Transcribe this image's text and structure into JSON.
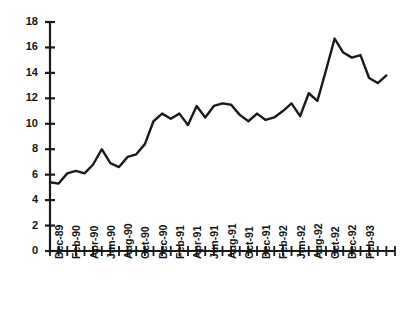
{
  "chart_data": {
    "type": "line",
    "title": "",
    "subtitle": "",
    "xlabel": "",
    "ylabel": "",
    "grid": false,
    "legend": false,
    "legend_position": "none",
    "line_color": "#1a1a1a",
    "background_color": "#ffffff",
    "ylim": [
      0,
      18
    ],
    "y_ticks": [
      0,
      2,
      4,
      6,
      8,
      10,
      12,
      14,
      16,
      18
    ],
    "y_tick_labels": [
      "0",
      "2",
      "4",
      "6",
      "8",
      "10",
      "12",
      "14",
      "16",
      "18"
    ],
    "x_tick_labels": [
      "Dec-89",
      "Feb-90",
      "Apr-90",
      "Jun-90",
      "Aug-90",
      "Oct-90",
      "Dec-90",
      "Feb-91",
      "Apr-91",
      "Jun-91",
      "Aug-91",
      "Oct-91",
      "Dec-91",
      "Feb-92",
      "Jun-92",
      "Aug-92",
      "Oct-92",
      "Dec-92",
      "Feb-93"
    ],
    "x_tick_label_interval": 2,
    "x_tick_count": 41,
    "x": [
      "Dec-89",
      "Jan-90",
      "Feb-90",
      "Mar-90",
      "Apr-90",
      "May-90",
      "Jun-90",
      "Jul-90",
      "Aug-90",
      "Sep-90",
      "Oct-90",
      "Nov-90",
      "Dec-90",
      "Jan-91",
      "Feb-91",
      "Mar-91",
      "Apr-91",
      "May-91",
      "Jun-91",
      "Jul-91",
      "Aug-91",
      "Sep-91",
      "Oct-91",
      "Nov-91",
      "Dec-91",
      "Jan-92",
      "Feb-92",
      "Mar-92",
      "Apr-92",
      "May-92",
      "Jun-92",
      "Jul-92",
      "Aug-92",
      "Sep-92",
      "Oct-92",
      "Nov-92",
      "Dec-92",
      "Jan-93",
      "Feb-93",
      "Mar-93"
    ],
    "values": [
      5.4,
      5.3,
      6.1,
      6.3,
      6.1,
      6.8,
      8.0,
      6.9,
      6.6,
      7.4,
      7.6,
      8.4,
      10.2,
      10.8,
      10.4,
      10.8,
      9.9,
      11.4,
      10.5,
      11.4,
      11.6,
      11.5,
      10.7,
      10.2,
      10.8,
      10.3,
      10.5,
      11.0,
      11.6,
      10.6,
      12.4,
      11.8,
      14.2,
      16.7,
      15.6,
      15.2,
      15.4,
      13.6,
      13.2,
      13.8
    ]
  }
}
